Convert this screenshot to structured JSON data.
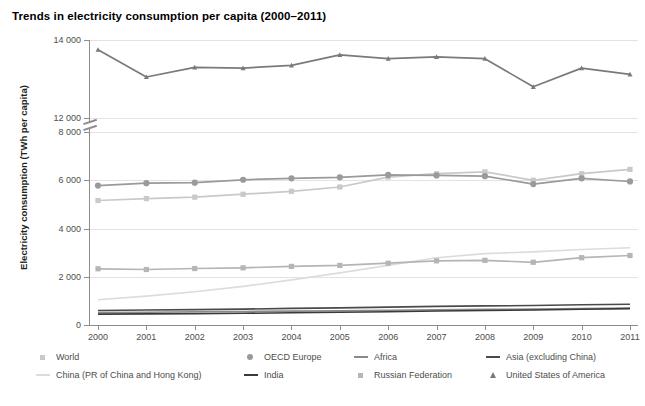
{
  "title": "Trends in electricity consumption per capita (2000–2011)",
  "axes": {
    "ylabel": "Electricity consumption (TWh per capita)",
    "xlabel": "",
    "ytick_labels": [
      "14 000",
      "12 000",
      "8 000",
      "6 000",
      "4 000",
      "2 000",
      "0"
    ],
    "xtick_labels": [
      "2000",
      "2001",
      "2002",
      "2003",
      "2004",
      "2005",
      "2006",
      "2007",
      "2008",
      "2009",
      "2010",
      "2011"
    ],
    "axis_break": true
  },
  "legend": {
    "items": [
      {
        "label": "World",
        "marker": "square",
        "color": "#c9c9c9"
      },
      {
        "label": "OECD Europe",
        "marker": "circle",
        "color": "#9a9a9a"
      },
      {
        "label": "Africa",
        "marker": "line",
        "color": "#8a8a8a"
      },
      {
        "label": "Asia (excluding China)",
        "marker": "line",
        "color": "#4a4a4a"
      },
      {
        "label": "China (PR of China and Hong Kong)",
        "marker": "line",
        "color": "#dcdcdc"
      },
      {
        "label": "India",
        "marker": "line",
        "color": "#3a3a3a"
      },
      {
        "label": "Russian Federation",
        "marker": "square",
        "color": "#b5b5b5"
      },
      {
        "label": "United States of America",
        "marker": "triangle",
        "color": "#7a7a7a"
      }
    ]
  },
  "chart_data": {
    "type": "line",
    "title": "Trends in electricity consumption per capita (2000–2011)",
    "xlabel": "",
    "ylabel": "Electricity consumption (TWh per capita)",
    "x": [
      2000,
      2001,
      2002,
      2003,
      2004,
      2005,
      2006,
      2007,
      2008,
      2009,
      2010,
      2011
    ],
    "ylim": [
      0,
      14000
    ],
    "yticks": [
      0,
      2000,
      4000,
      6000,
      8000,
      12000,
      14000
    ],
    "axis_break_between": [
      8000,
      12000
    ],
    "grid": true,
    "legend_position": "bottom",
    "series": [
      {
        "name": "United States of America",
        "color": "#7a7a7a",
        "marker": "triangle",
        "values": [
          13750,
          13050,
          13300,
          13280,
          13350,
          13620,
          13520,
          13570,
          13520,
          12800,
          13280,
          13120
        ]
      },
      {
        "name": "OECD Europe",
        "color": "#9a9a9a",
        "marker": "circle",
        "values": [
          5780,
          5880,
          5900,
          6020,
          6080,
          6120,
          6220,
          6200,
          6170,
          5840,
          6080,
          5950
        ]
      },
      {
        "name": "World",
        "color": "#c9c9c9",
        "marker": "square",
        "values": [
          5160,
          5240,
          5300,
          5420,
          5540,
          5720,
          6130,
          6270,
          6350,
          6000,
          6270,
          6450
        ]
      },
      {
        "name": "Russian Federation",
        "color": "#b5b5b5",
        "marker": "square",
        "values": [
          2330,
          2300,
          2340,
          2370,
          2430,
          2470,
          2560,
          2660,
          2680,
          2600,
          2790,
          2880
        ]
      },
      {
        "name": "China (PR of China and Hong Kong)",
        "color": "#dcdcdc",
        "marker": "none",
        "values": [
          1050,
          1200,
          1380,
          1600,
          1870,
          2160,
          2470,
          2790,
          2960,
          3030,
          3130,
          3200
        ]
      },
      {
        "name": "Asia (excluding China)",
        "color": "#4a4a4a",
        "marker": "none",
        "values": [
          600,
          620,
          640,
          660,
          690,
          710,
          740,
          770,
          790,
          810,
          840,
          860
        ]
      },
      {
        "name": "Africa",
        "color": "#8a8a8a",
        "marker": "none",
        "values": [
          520,
          530,
          545,
          560,
          575,
          590,
          610,
          630,
          650,
          660,
          680,
          700
        ]
      },
      {
        "name": "India",
        "color": "#3a3a3a",
        "marker": "none",
        "values": [
          450,
          460,
          470,
          485,
          505,
          525,
          550,
          580,
          600,
          620,
          650,
          680
        ]
      }
    ]
  }
}
